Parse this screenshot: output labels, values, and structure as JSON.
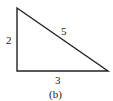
{
  "figure": {
    "caption": "(b)",
    "shape": "right-triangle",
    "stroke_color": "#222222",
    "background": "#ffffff",
    "vertices": {
      "top": [
        17,
        8
      ],
      "right_angle": [
        17,
        71
      ],
      "right": [
        108,
        71
      ]
    },
    "sides": {
      "vertical": "2",
      "hypotenuse": "5",
      "horizontal": "3"
    }
  }
}
